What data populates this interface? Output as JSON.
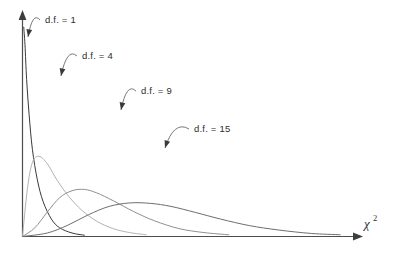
{
  "chart_data": {
    "type": "line",
    "title": "",
    "subtitle": "",
    "xlabel": "χ²",
    "xlabel_base": "χ",
    "xlabel_superscript": "2",
    "ylabel": "",
    "grid": false,
    "legend_position": "inline-annotations",
    "axes": {
      "x_axis_arrow": true,
      "y_axis_arrow": true,
      "x_ticks": [],
      "y_ticks": [],
      "xlim": [
        0,
        40
      ],
      "ylim": [
        0,
        0.5
      ]
    },
    "series": [
      {
        "name": "d.f. = 1",
        "df": 1,
        "color": "#3a3a3a",
        "stroke_width": 1.0,
        "peak_x": 0,
        "x": [
          0.15,
          0.3,
          0.5,
          0.8,
          1.2,
          1.8,
          2.5,
          3.5,
          4.5,
          6.0,
          7.5
        ],
        "y": [
          0.48,
          0.44,
          0.36,
          0.28,
          0.2,
          0.13,
          0.08,
          0.04,
          0.02,
          0.008,
          0.003
        ]
      },
      {
        "name": "d.f. = 4",
        "df": 4,
        "color": "#b2b2b2",
        "stroke_width": 1.0,
        "peak_x": 2,
        "x": [
          0.0,
          0.6,
          1.2,
          2.0,
          3.0,
          4.2,
          5.6,
          7.2,
          9.0,
          11.0,
          13.0,
          15.0
        ],
        "y": [
          0.0,
          0.11,
          0.17,
          0.184,
          0.167,
          0.129,
          0.092,
          0.06,
          0.035,
          0.018,
          0.009,
          0.004
        ]
      },
      {
        "name": "d.f. = 9",
        "df": 9,
        "color": "#8f8f8f",
        "stroke_width": 1.0,
        "peak_x": 7,
        "x": [
          0.0,
          1.5,
          3.0,
          4.5,
          6.0,
          7.5,
          9.0,
          11.0,
          13.5,
          16.0,
          19.0,
          22.0,
          25.0
        ],
        "y": [
          0.0,
          0.02,
          0.056,
          0.089,
          0.105,
          0.108,
          0.1,
          0.082,
          0.057,
          0.036,
          0.018,
          0.009,
          0.004
        ]
      },
      {
        "name": "d.f. = 15",
        "df": 15,
        "color": "#6e6e6e",
        "stroke_width": 1.0,
        "peak_x": 13,
        "x": [
          0.0,
          3.0,
          5.5,
          8.0,
          10.5,
          13.0,
          15.5,
          18.0,
          21.0,
          24.0,
          27.5,
          31.0,
          35.0,
          38.5
        ],
        "y": [
          0.0,
          0.008,
          0.026,
          0.05,
          0.069,
          0.077,
          0.076,
          0.069,
          0.055,
          0.04,
          0.025,
          0.015,
          0.007,
          0.004
        ]
      }
    ],
    "annotations": [
      {
        "label": "d.f. = 1",
        "label_x": 45,
        "label_y": 23,
        "points_to_x": 28,
        "points_to_y": 37
      },
      {
        "label": "d.f. = 4",
        "label_x": 82,
        "label_y": 59,
        "points_to_x": 61,
        "points_to_y": 76
      },
      {
        "label": "d.f. = 9",
        "label_x": 141,
        "label_y": 94,
        "points_to_x": 121,
        "points_to_y": 110
      },
      {
        "label": "d.f. = 15",
        "label_x": 194,
        "label_y": 132,
        "points_to_x": 165,
        "points_to_y": 148
      }
    ]
  }
}
